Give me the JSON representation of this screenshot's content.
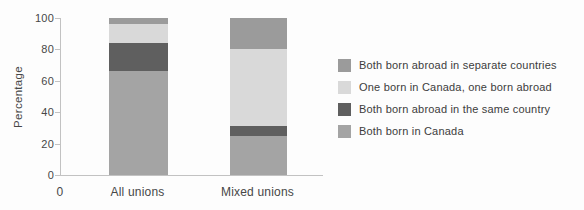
{
  "chart_data": {
    "type": "bar",
    "stacked": true,
    "title": "",
    "xlabel": "",
    "ylabel": "Percentage",
    "ylim": [
      0,
      100
    ],
    "yticks": [
      100,
      80,
      60,
      40,
      20,
      0
    ],
    "x_origin_label": "0",
    "categories": [
      "All unions",
      "Mixed unions"
    ],
    "series": [
      {
        "name": "Both born in Canada",
        "color": "#a4a4a4",
        "values": [
          66,
          25
        ]
      },
      {
        "name": "Both born abroad in the same country",
        "color": "#5f5f5f",
        "values": [
          18,
          6
        ]
      },
      {
        "name": "One born in Canada, one born abroad",
        "color": "#d9d9d9",
        "values": [
          12,
          49
        ]
      },
      {
        "name": "Both born abroad in separate countries",
        "color": "#9b9b9b",
        "values": [
          4,
          20
        ]
      }
    ],
    "legend_position": "right",
    "legend_order": [
      "Both born abroad in separate countries",
      "One born in Canada, one born abroad",
      "Both born abroad in the same country",
      "Both born in Canada"
    ],
    "grid": false,
    "axis_color": "#c2c2c2"
  }
}
